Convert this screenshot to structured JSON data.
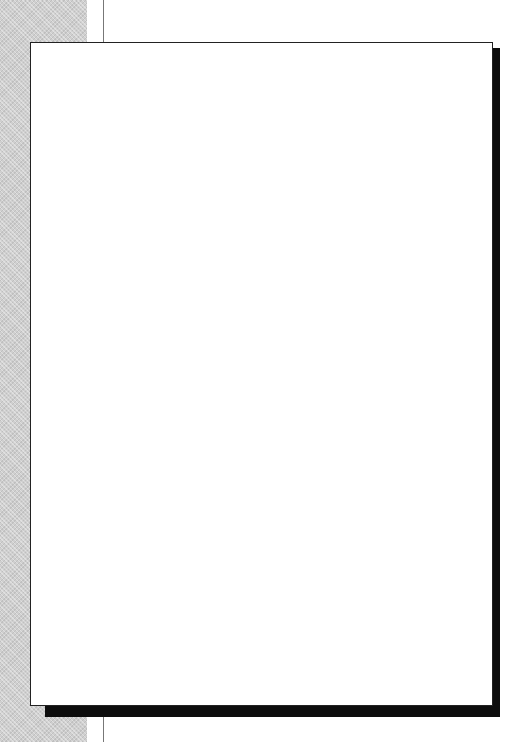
{
  "colors": {
    "stroke": "#222222",
    "shadow": "#0d0d0d",
    "band": "#cfcfcf"
  },
  "sections": [
    {
      "id": "why",
      "label": "WHY",
      "letters": [
        "W",
        "H",
        "Y"
      ],
      "bracket": {
        "top": 101,
        "bottom": 235
      },
      "label_top": 140
    },
    {
      "id": "what",
      "label": "WHAT",
      "letters": [
        "W",
        "H",
        "A",
        "T"
      ],
      "bracket": {
        "top": 249,
        "bottom": 468
      },
      "label_top": 325
    },
    {
      "id": "how",
      "label": "HOW",
      "letters": [
        "H",
        "O",
        "W"
      ],
      "bracket": {
        "top": 484,
        "bottom": 616
      },
      "label_top": 527
    }
  ],
  "diamonds": [
    {
      "id": "needs-assessment",
      "label": "Needs\nAssessment",
      "cx": 101,
      "cy": 131
    },
    {
      "id": "training-demand",
      "label": "Training\nDemand",
      "cx": 101,
      "cy": 205
    },
    {
      "id": "strategy",
      "label": "Strategy",
      "cx": 101,
      "cy": 278
    },
    {
      "id": "goal",
      "label": "Goal",
      "cx": 101,
      "cy": 366
    },
    {
      "id": "objective",
      "label": "Objective",
      "cx": 101,
      "cy": 440
    },
    {
      "id": "tactics",
      "label": "Tactics",
      "cx": 101,
      "cy": 513
    },
    {
      "id": "outcome",
      "label": "Outcome",
      "cx": 101,
      "cy": 587
    },
    {
      "id": "evaluation",
      "label": "Evaluation",
      "cx": 101,
      "cy": 661
    }
  ],
  "boxes": [
    {
      "id": "organizational",
      "label": "Organizational",
      "x": 158,
      "y": 116
    },
    {
      "id": "individual",
      "label": "Individual",
      "x": 270,
      "y": 116
    },
    {
      "id": "master-schedule",
      "label": "Master Schedule",
      "x": 158,
      "y": 190
    },
    {
      "id": "training-plans",
      "label": "Training Plans",
      "x": 270,
      "y": 190
    },
    {
      "id": "program-selection",
      "label": "Program Selection",
      "x": 383,
      "y": 189
    },
    {
      "id": "why-box",
      "label": "Why",
      "x": 158,
      "y": 263
    },
    {
      "id": "value",
      "label": "Value",
      "x": 270,
      "y": 263
    },
    {
      "id": "key-items",
      "label": "Key Items",
      "x": 158,
      "y": 499
    },
    {
      "id": "mechanics",
      "label": "Mechanics",
      "x": 270,
      "y": 499
    },
    {
      "id": "material-designs",
      "label": "Material Designs",
      "x": 383,
      "y": 499
    }
  ],
  "connectors": [
    {
      "from": "needs-assessment",
      "to": "organizational"
    },
    {
      "from": "organizational",
      "to": "individual"
    },
    {
      "from": "individual",
      "to": "training-demand"
    },
    {
      "from": "training-demand",
      "to": "master-schedule"
    },
    {
      "from": "master-schedule",
      "to": "training-plans"
    },
    {
      "from": "training-plans",
      "to": "program-selection"
    },
    {
      "from": "master-schedule",
      "to": "strategy"
    },
    {
      "from": "training-plans",
      "to": "strategy"
    },
    {
      "from": "program-selection",
      "to": "strategy"
    },
    {
      "from": "strategy",
      "to": "why-box"
    },
    {
      "from": "why-box",
      "to": "value"
    },
    {
      "from": "value",
      "to": "goal"
    },
    {
      "from": "goal",
      "to": "objective"
    },
    {
      "from": "objective",
      "to": "tactics"
    },
    {
      "from": "tactics",
      "to": "key-items"
    },
    {
      "from": "key-items",
      "to": "mechanics"
    },
    {
      "from": "mechanics",
      "to": "material-designs"
    },
    {
      "from": "material-designs",
      "to": "outcome"
    },
    {
      "from": "outcome",
      "to": "evaluation"
    }
  ]
}
